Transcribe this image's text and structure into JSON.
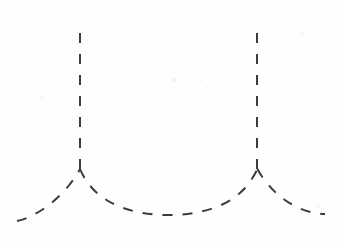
{
  "figure": {
    "title": "",
    "background_color": "#fefefe",
    "stroke_color": "#3c3c40",
    "stroke_width": 2,
    "dash_pattern": "10 10",
    "width": 340,
    "height": 242
  },
  "chart_data": {
    "type": "line",
    "title": "",
    "subtitle": "",
    "xlabel": "",
    "ylabel": "",
    "xlim": [
      0,
      340
    ],
    "ylim": [
      242,
      0
    ],
    "grid": false,
    "legend": null,
    "axes_visible": false,
    "tick_labels_x": [],
    "tick_labels_y": [],
    "annotations": [],
    "style": {
      "linestyle": "dashed",
      "marker": "none"
    },
    "asymptotes": [
      {
        "name": "left-asymptote",
        "x": 80,
        "y_top": 33,
        "y_bottom": 170
      },
      {
        "name": "right-asymptote",
        "x": 257,
        "y_top": 33,
        "y_bottom": 170
      }
    ],
    "series": [
      {
        "name": "left-outer-branch",
        "points": [
          [
            18,
            221
          ],
          [
            34,
            215
          ],
          [
            52,
            203
          ],
          [
            66,
            188
          ],
          [
            76,
            176
          ],
          [
            80,
            170
          ]
        ]
      },
      {
        "name": "middle-arc",
        "points": [
          [
            80,
            170
          ],
          [
            88,
            180
          ],
          [
            100,
            192
          ],
          [
            118,
            203
          ],
          [
            140,
            211
          ],
          [
            168,
            214
          ],
          [
            196,
            211
          ],
          [
            218,
            203
          ],
          [
            236,
            192
          ],
          [
            249,
            180
          ],
          [
            257,
            170
          ]
        ]
      },
      {
        "name": "right-outer-branch",
        "points": [
          [
            257,
            170
          ],
          [
            265,
            180
          ],
          [
            278,
            192
          ],
          [
            294,
            203
          ],
          [
            310,
            211
          ],
          [
            325,
            214
          ]
        ]
      }
    ],
    "key_values": {
      "cusp_y": 170,
      "trough_y": 214,
      "trough_x": 168,
      "asymptote_left_x": 80,
      "asymptote_right_x": 257,
      "period_px": 177
    }
  }
}
